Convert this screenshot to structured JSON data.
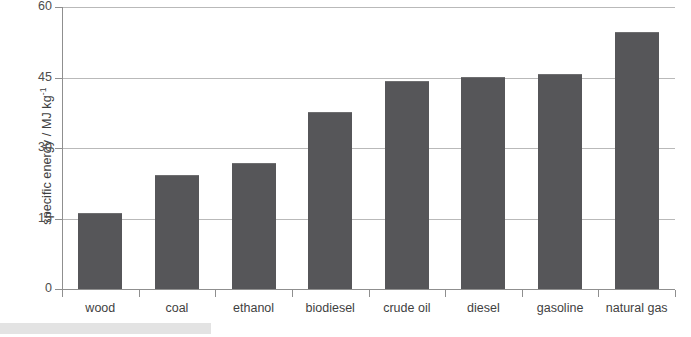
{
  "chart_data": {
    "type": "bar",
    "title": "",
    "xlabel": "",
    "ylabel": "specific energy / MJ kg",
    "ylabel_exponent": "-1",
    "categories": [
      "wood",
      "coal",
      "ethanol",
      "biodiesel",
      "crude oil",
      "diesel",
      "gasoline",
      "natural gas"
    ],
    "values": [
      16,
      24,
      26.5,
      37.5,
      44,
      45,
      45.5,
      54.5
    ],
    "ylim": [
      0,
      60
    ],
    "yticks": [
      0,
      15,
      30,
      45,
      60
    ],
    "ytick_labels": [
      "0",
      "15",
      "30",
      "45",
      "60"
    ],
    "grid": true,
    "legend": "none",
    "bar_color": "#565659",
    "gridline_color": "#b9b9b9",
    "axis_color": "#8f8f8f",
    "text_color": "#3f3f3f"
  }
}
